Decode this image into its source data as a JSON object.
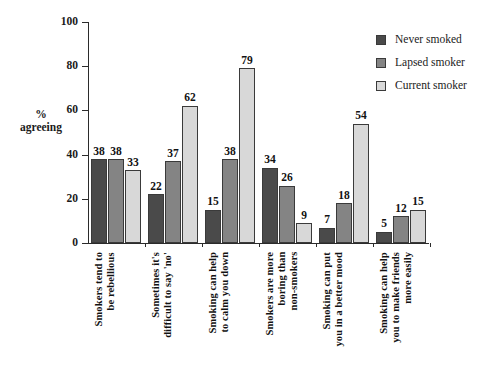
{
  "chart_data": {
    "type": "bar",
    "title": "",
    "subtitle": "",
    "xlabel": "",
    "ylabel": "%\nagreeing",
    "ylim": [
      0,
      100
    ],
    "yticks": [
      0,
      20,
      40,
      60,
      80,
      100
    ],
    "ytick_labels": [
      "0",
      "20",
      "40",
      "60",
      "80",
      "100"
    ],
    "grid": false,
    "legend_position": "top-right",
    "data_labels": true,
    "categories": [
      "Smokers tend to\nbe rebellious",
      "Sometimes it's\ndifficult to say 'no'",
      "Smoking can help\nto calm you down",
      "Smokers are more\nboring than\nnon-smokers",
      "Smoking can put\nyou in a better mood",
      "Smoking can help\nyou to make friends\nmore easily"
    ],
    "series": [
      {
        "name": "Never smoked",
        "color": "#4a4a4a",
        "values": [
          38,
          22,
          15,
          34,
          7,
          5
        ]
      },
      {
        "name": "Lapsed smoker",
        "color": "#848484",
        "values": [
          38,
          37,
          38,
          26,
          18,
          12
        ]
      },
      {
        "name": "Current smoker",
        "color": "#d8d8d8",
        "values": [
          33,
          62,
          79,
          9,
          54,
          15
        ]
      }
    ]
  },
  "legend": {
    "items": [
      {
        "label": "Never smoked",
        "color": "#4a4a4a"
      },
      {
        "label": "Lapsed smoker",
        "color": "#848484"
      },
      {
        "label": "Current smoker",
        "color": "#d8d8d8"
      }
    ]
  },
  "axis": {
    "y_title_line1": "%",
    "y_title_line2": "agreeing"
  }
}
